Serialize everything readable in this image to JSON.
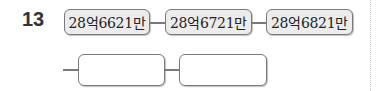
{
  "problem": {
    "number": "13",
    "row1": {
      "boxes": [
        {
          "value": "28억6621만"
        },
        {
          "value": "28억6721만"
        },
        {
          "value": "28억6821만"
        }
      ]
    },
    "row2": {
      "boxes": [
        {
          "value": ""
        },
        {
          "value": ""
        }
      ]
    }
  },
  "colors": {
    "box_border": "#7a7a7a",
    "box_fill": "#ececec",
    "text": "#222222"
  }
}
